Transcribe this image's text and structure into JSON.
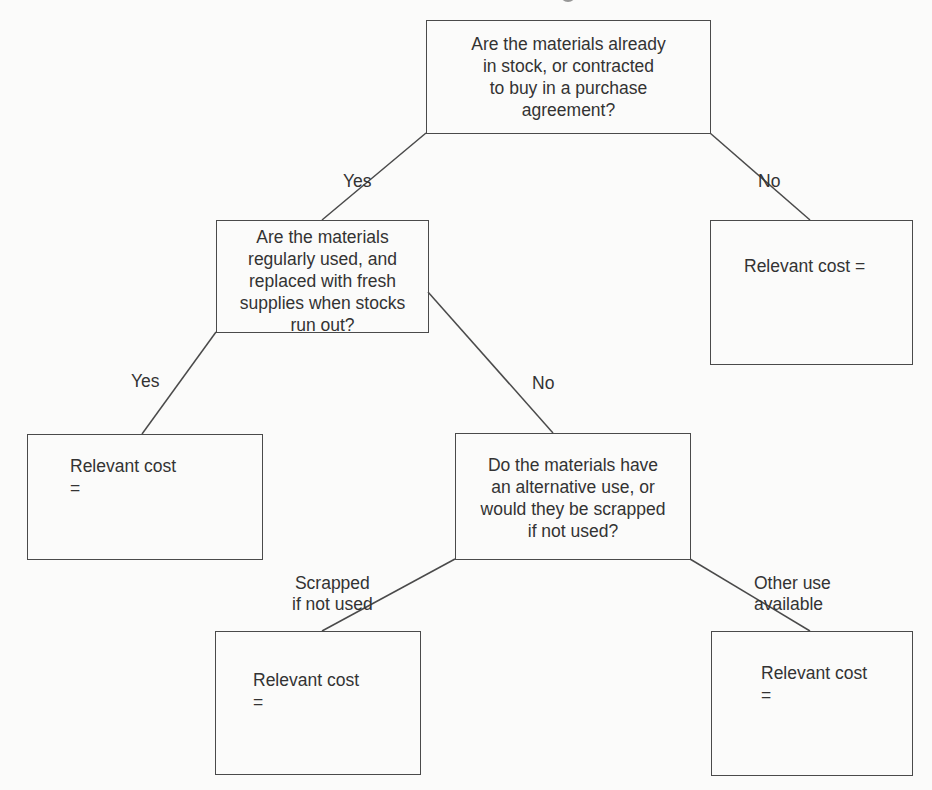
{
  "diagram": {
    "type": "decision-tree",
    "nodes": {
      "q1": {
        "text": "Are the materials already\nin stock, or contracted\nto buy in a purchase\nagreement?"
      },
      "q2": {
        "text": "Are the materials\nregularly used, and\nreplaced with fresh\nsupplies when stocks\nrun out?"
      },
      "q3": {
        "text": "Do the materials have\nan alternative use, or\nwould they be scrapped\nif not used?"
      },
      "r_not_in_stock": {
        "text": "Relevant cost ="
      },
      "r_regularly_used": {
        "text": "Relevant cost\n="
      },
      "r_scrapped": {
        "text": "Relevant cost\n="
      },
      "r_other_use": {
        "text": "Relevant cost\n="
      }
    },
    "edges": [
      {
        "from": "q1",
        "to": "q2",
        "label": "Yes"
      },
      {
        "from": "q1",
        "to": "r_not_in_stock",
        "label": "No"
      },
      {
        "from": "q2",
        "to": "r_regularly_used",
        "label": "Yes"
      },
      {
        "from": "q2",
        "to": "q3",
        "label": "No"
      },
      {
        "from": "q3",
        "to": "r_scrapped",
        "label": "Scrapped\nif not used"
      },
      {
        "from": "q3",
        "to": "r_other_use",
        "label": "Other use\navailable"
      }
    ]
  }
}
